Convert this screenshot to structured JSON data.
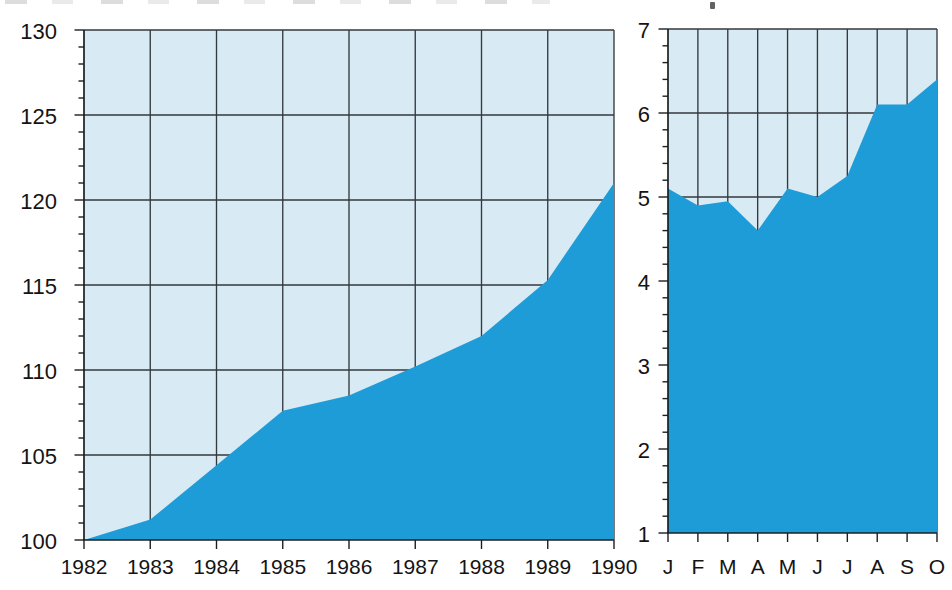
{
  "figure": {
    "title": "",
    "legend": "none"
  },
  "colors": {
    "page_background": "#ffffff",
    "plot_background": "#d8eaf3",
    "area_fill": "#1d9cd8",
    "grid_line": "#34393e",
    "axis_line": "#1c1f22",
    "tick_label": "#141414"
  },
  "chart_data": [
    {
      "id": "annual-index-area-chart",
      "type": "area",
      "title": "",
      "xlabel": "",
      "ylabel": "",
      "categories": [
        "1982",
        "1983",
        "1984",
        "1985",
        "1986",
        "1987",
        "1988",
        "1989",
        "1990"
      ],
      "values": [
        100,
        101.2,
        104.4,
        107.6,
        108.5,
        110.2,
        112,
        115.3,
        121
      ],
      "ylim": [
        100,
        130
      ],
      "ytick_major": 5,
      "ytick_minor": 1,
      "ytick_labels": [
        "100",
        "105",
        "110",
        "115",
        "120",
        "125",
        "130"
      ],
      "grid": true,
      "legend_position": "none"
    },
    {
      "id": "monthly-area-chart",
      "type": "area",
      "title": "",
      "xlabel": "",
      "ylabel": "",
      "categories": [
        "J",
        "F",
        "M",
        "A",
        "M",
        "J",
        "J",
        "A",
        "S",
        "O"
      ],
      "values": [
        5.1,
        4.9,
        4.95,
        4.6,
        5.1,
        5.0,
        5.25,
        6.1,
        6.1,
        6.4
      ],
      "ylim": [
        1,
        7
      ],
      "ytick_major": 1,
      "ytick_minor": 0.2,
      "ytick_labels": [
        "1",
        "2",
        "3",
        "4",
        "5",
        "6",
        "7"
      ],
      "grid": true,
      "legend_position": "none"
    }
  ]
}
